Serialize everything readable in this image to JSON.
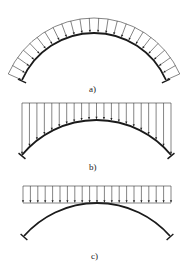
{
  "diagram": {
    "type": "arch-load-cases",
    "colors": {
      "line": "#1a1a1a",
      "background": "#ffffff"
    },
    "panels": [
      {
        "id": "a",
        "label": "a)",
        "load": "radial-uniform",
        "description": "Uniform radial load normal to arch",
        "arrow_count": 24
      },
      {
        "id": "b",
        "label": "b)",
        "load": "vertical-to-arch",
        "description": "Vertical load from horizontal line down to arch axis",
        "arrow_count": 21
      },
      {
        "id": "c",
        "label": "c)",
        "load": "uniform-vertical-band",
        "description": "Uniform vertical distributed load band above arch",
        "arrow_count": 21
      }
    ]
  }
}
